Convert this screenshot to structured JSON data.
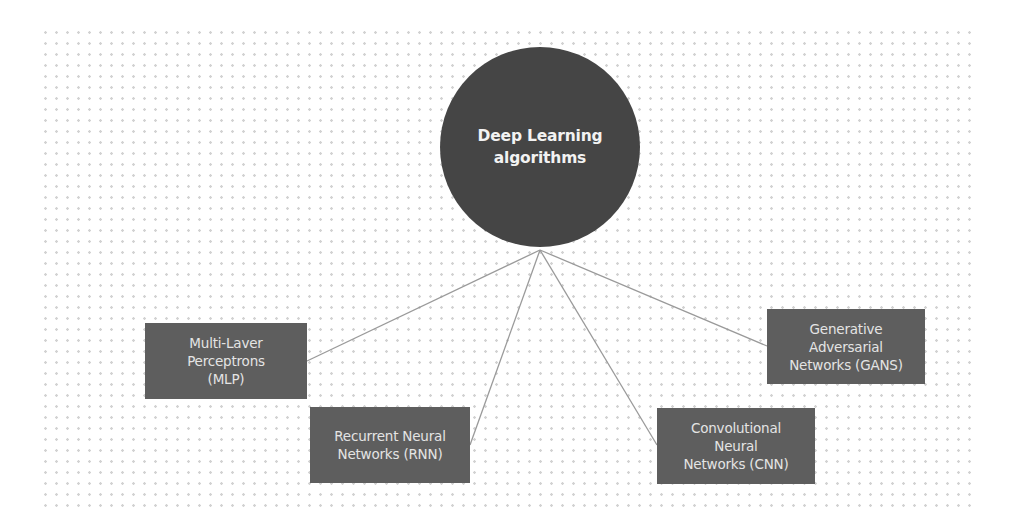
{
  "diagram": {
    "type": "hub-and-spoke",
    "colors": {
      "background": "#ffffff",
      "grid_dots": "#d2d2d2",
      "hub_fill": "#454545",
      "hub_text": "#f2f2f2",
      "node_fill": "#5e5e5e",
      "node_text": "#e4e4e4",
      "connector": "#9a9a9a"
    },
    "hub": {
      "lines": [
        "Deep Learning",
        "algorithms"
      ]
    },
    "nodes": [
      {
        "id": "mlp",
        "lines": [
          "Multi-Laver",
          "Perceptrons",
          "(MLP)"
        ]
      },
      {
        "id": "rnn",
        "lines": [
          "Recurrent Neural",
          "Networks (RNN)"
        ]
      },
      {
        "id": "cnn",
        "lines": [
          "Convolutional",
          "Neural",
          "Networks (CNN)"
        ]
      },
      {
        "id": "gans",
        "lines": [
          "Generative",
          "Adversarial",
          "Networks (GANS)"
        ]
      }
    ],
    "edges": [
      {
        "from": "hub",
        "to": "mlp"
      },
      {
        "from": "hub",
        "to": "rnn"
      },
      {
        "from": "hub",
        "to": "cnn"
      },
      {
        "from": "hub",
        "to": "gans"
      }
    ]
  }
}
